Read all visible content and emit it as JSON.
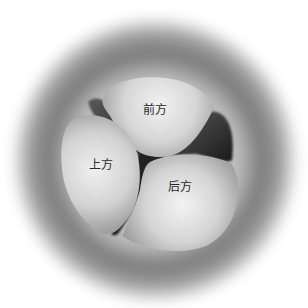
{
  "diagram": {
    "labels": {
      "anterior": "前方",
      "superior": "上方",
      "posterior": "后方"
    },
    "colors": {
      "background": "#ffffff",
      "ring_dark": "#6e6e6e",
      "ring_light": "#d9d9d9",
      "cusp_light": "#eeeeee",
      "cusp_shade": "#9c9c9c",
      "gap_dark": "#1e1e1e"
    }
  }
}
